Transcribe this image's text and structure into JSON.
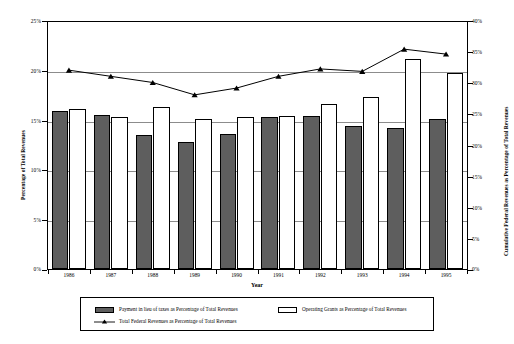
{
  "chart_data": {
    "type": "bar",
    "title": "",
    "xlabel": "Year",
    "ylabel": "Percentage of Total Revenues",
    "y2label": "Cumulative Federal Revenues as Percentage of Total Revenues",
    "categories": [
      "1986",
      "1987",
      "1988",
      "1989",
      "1990",
      "1991",
      "1992",
      "1993",
      "1994",
      "1995"
    ],
    "ylim": [
      0,
      25
    ],
    "y2lim": [
      0,
      40
    ],
    "yticks": [
      "0%",
      "5%",
      "10%",
      "15%",
      "20%",
      "25%"
    ],
    "y2ticks": [
      "0%",
      "5%",
      "10%",
      "15%",
      "20%",
      "25%",
      "30%",
      "35%",
      "40%"
    ],
    "grid": true,
    "legend_position": "bottom",
    "series": [
      {
        "name": "Payment in lieu of taxes as Percentage of Total Revenues",
        "kind": "bar",
        "axis": "left",
        "color": "#5e5e5e",
        "values": [
          16.0,
          15.6,
          13.6,
          12.9,
          13.7,
          15.4,
          15.5,
          14.5,
          14.3,
          15.2
        ]
      },
      {
        "name": "Operating Grants as Percentage of Total Revenues",
        "kind": "bar",
        "axis": "left",
        "color": "#ffffff",
        "values": [
          16.2,
          15.4,
          16.4,
          15.15,
          15.4,
          15.5,
          16.75,
          17.4,
          21.3,
          19.8
        ]
      },
      {
        "name": "Total Federal Revenues as Percentage of Total Revenues",
        "kind": "line",
        "axis": "right",
        "color": "#000000",
        "values": [
          32.2,
          31.2,
          30.2,
          28.2,
          29.3,
          31.2,
          32.4,
          32.0,
          35.6,
          34.8
        ]
      }
    ]
  },
  "legend": {
    "items": [
      {
        "label": "Payment in lieu of taxes as Percentage of Total Revenues",
        "marker": "dark-swatch"
      },
      {
        "label": "Operating Grants as Percentage of Total Revenues",
        "marker": "light-swatch"
      },
      {
        "label": "Total Federal Revenues as Percentage of Total Revenues",
        "marker": "line-triangle-marker"
      }
    ]
  }
}
